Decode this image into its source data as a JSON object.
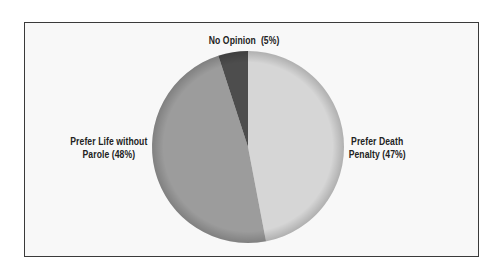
{
  "chart_data": {
    "type": "pie",
    "title": "",
    "categories": [
      "Prefer Death Penalty",
      "Prefer Life without Parole",
      "No Opinion"
    ],
    "values": [
      47,
      48,
      5
    ],
    "unit": "%",
    "start_angle": "12 o'clock",
    "direction": "clockwise",
    "colors": [
      "#d6d6d6",
      "#9c9c9c",
      "#4d4d4d"
    ],
    "labels": {
      "death": {
        "line1": "Prefer Death",
        "line2": "Penalty (47%)"
      },
      "life": {
        "line1": "Prefer Life without",
        "line2": "Parole (48%)"
      },
      "none": {
        "line1": "No Opinion  (5%)"
      }
    },
    "legend": "none (labels placed beside slices)"
  }
}
